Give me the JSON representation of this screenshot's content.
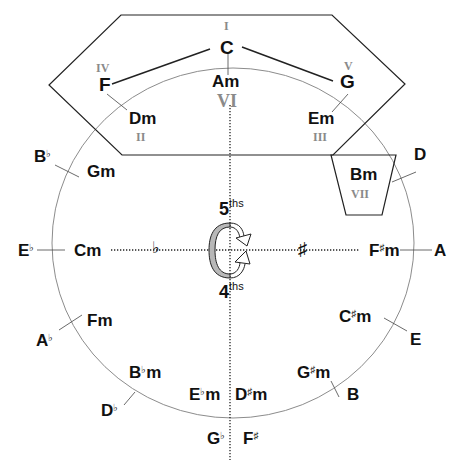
{
  "diagram": {
    "key_highlight": {
      "tonic": "C",
      "numerals": {
        "I": "I",
        "II": "II",
        "III": "III",
        "IV": "IV",
        "V": "V",
        "VI": "VI",
        "VII": "VII"
      }
    },
    "major_keys": {
      "C": "C",
      "G": "G",
      "D": "D",
      "A": "A",
      "E": "E",
      "B": "B",
      "Gb": "G",
      "Fs": "F",
      "Db": "D",
      "Ab": "A",
      "Eb": "E",
      "Bb": "B",
      "F": "F"
    },
    "minor_keys": {
      "Am": "Am",
      "Em": "Em",
      "Bm": "Bm",
      "Fsm_root": "F",
      "Csm_root": "C",
      "Gsm_root": "G",
      "Dsm_root": "D",
      "Ebm_root": "E",
      "Bbm_root": "B",
      "Fm": "Fm",
      "Cm": "Cm",
      "Gm": "Gm",
      "Dm": "Dm",
      "m": "m"
    },
    "accidentals": {
      "flat": "♭",
      "sharp": "♯"
    },
    "center": {
      "fifths_num": "5",
      "fifths_sup": "ths",
      "fourths_num": "4",
      "fourths_sup": "ths",
      "flat_side": "♭",
      "sharp_side": "♯"
    },
    "colors": {
      "line": "#222222",
      "circle": "#8c8c8c",
      "numeral": "#8a8a8a",
      "arrow_fill": "#b8b8b8"
    }
  }
}
